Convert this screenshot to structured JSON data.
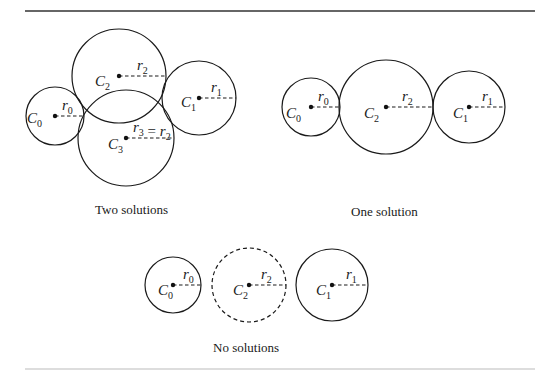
{
  "figure": {
    "panels": [
      {
        "id": "two-solutions",
        "caption": "Two solutions",
        "caption_pos": [
          95,
          214
        ],
        "circles": [
          {
            "name": "C0",
            "cx": 55,
            "cy": 116,
            "r": 29,
            "dashed": false,
            "radius_label": "r0",
            "label_pos": [
              27,
              123
            ],
            "rlabel_pos": [
              62,
              110
            ]
          },
          {
            "name": "C2",
            "cx": 119,
            "cy": 76,
            "r": 47,
            "dashed": false,
            "radius_label": "r2",
            "label_pos": [
              95,
              86
            ],
            "rlabel_pos": [
              137,
              70
            ]
          },
          {
            "name": "C1",
            "cx": 199,
            "cy": 98,
            "r": 37,
            "dashed": false,
            "radius_label": "r1",
            "label_pos": [
              181,
              107
            ],
            "rlabel_pos": [
              211,
              92
            ]
          },
          {
            "name": "C3",
            "cx": 126,
            "cy": 138,
            "r": 48,
            "dashed": false,
            "radius_label": "r3 = r2",
            "label_pos": [
              108,
              149
            ],
            "rlabel_pos": [
              133,
              132
            ]
          }
        ]
      },
      {
        "id": "one-solution",
        "caption": "One solution",
        "caption_pos": [
          351,
          216
        ],
        "circles": [
          {
            "name": "C0",
            "cx": 311,
            "cy": 107,
            "r": 29,
            "dashed": false,
            "radius_label": "r0",
            "label_pos": [
              286,
              118
            ],
            "rlabel_pos": [
              318,
              101
            ]
          },
          {
            "name": "C2",
            "cx": 386,
            "cy": 107,
            "r": 47,
            "dashed": false,
            "radius_label": "r2",
            "label_pos": [
              364,
              118
            ],
            "rlabel_pos": [
              402,
              101
            ]
          },
          {
            "name": "C1",
            "cx": 469,
            "cy": 107,
            "r": 36,
            "dashed": false,
            "radius_label": "r1",
            "label_pos": [
              453,
              118
            ],
            "rlabel_pos": [
              482,
              101
            ]
          }
        ]
      },
      {
        "id": "no-solutions",
        "caption": "No solutions",
        "caption_pos": [
          213,
          352
        ],
        "circles": [
          {
            "name": "C0",
            "cx": 173,
            "cy": 285,
            "r": 28,
            "dashed": false,
            "radius_label": "r0",
            "label_pos": [
              158,
              295
            ],
            "rlabel_pos": [
              183,
              279
            ]
          },
          {
            "name": "C2",
            "cx": 249,
            "cy": 285,
            "r": 37,
            "dashed": true,
            "radius_label": "r2",
            "label_pos": [
              233,
              295
            ],
            "rlabel_pos": [
              261,
              279
            ]
          },
          {
            "name": "C1",
            "cx": 332,
            "cy": 285,
            "r": 36,
            "dashed": false,
            "radius_label": "r1",
            "label_pos": [
              316,
              295
            ],
            "rlabel_pos": [
              346,
              279
            ]
          }
        ]
      }
    ],
    "rules": {
      "top": {
        "x1": 25,
        "x2": 535,
        "y": 11
      },
      "bottom": {
        "x1": 25,
        "x2": 535,
        "y": 369
      }
    }
  }
}
